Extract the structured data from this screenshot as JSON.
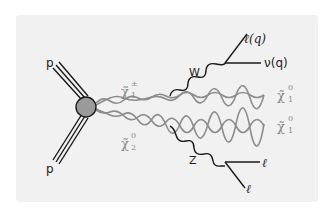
{
  "diagram": {
    "title": "",
    "type": "feynman",
    "colors": {
      "background": "#ffffff",
      "panel": "#f1f1f1",
      "ink": "#1a1a1a",
      "sparticle_line": "#8c8c8c",
      "blob_fill": "#9a9a9a",
      "sparticle_label": "#888888"
    },
    "incoming": [
      {
        "label": "p",
        "position": "upper-left"
      },
      {
        "label": "p",
        "position": "lower-left"
      }
    ],
    "vertex": {
      "name": "interaction-blob"
    },
    "sparticles": [
      {
        "base": "χ̃",
        "sup": "±",
        "sub": "1",
        "role": "chargino"
      },
      {
        "base": "χ̃",
        "sup": "0",
        "sub": "2",
        "role": "neutralino-2"
      }
    ],
    "bosons": [
      {
        "label": "W",
        "from": "chargino"
      },
      {
        "label": "Z",
        "from": "neutralino-2"
      }
    ],
    "final_states": {
      "w_decay": [
        {
          "label": "ℓ(q)"
        },
        {
          "label": "ν(q)"
        }
      ],
      "z_decay": [
        {
          "label": "ℓ"
        },
        {
          "label": "ℓ"
        }
      ],
      "lsp": [
        {
          "base": "χ̃",
          "sup": "0",
          "sub": "1"
        },
        {
          "base": "χ̃",
          "sup": "0",
          "sub": "1"
        }
      ]
    }
  }
}
